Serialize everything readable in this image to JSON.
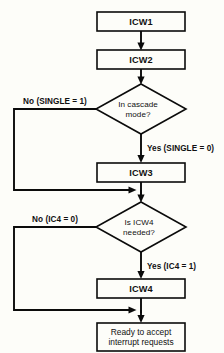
{
  "diagram": {
    "background_color": "#fdfdf9",
    "line_color": "#0b0b0b",
    "nodes": {
      "icw1": {
        "label": "ICW1",
        "type": "process"
      },
      "icw2": {
        "label": "ICW2",
        "type": "process"
      },
      "cascade_decision": {
        "type": "decision",
        "line1": "In cascade",
        "line2": "mode?"
      },
      "icw3": {
        "label": "ICW3",
        "type": "process"
      },
      "icw4_decision": {
        "type": "decision",
        "line1": "Is ICW4",
        "line2": "needed?"
      },
      "icw4": {
        "label": "ICW4",
        "type": "process"
      },
      "ready": {
        "type": "terminal",
        "line1": "Ready to accept",
        "line2": "interrupt requests"
      }
    },
    "edges": {
      "cascade_no": "No (SINGLE = 1)",
      "cascade_yes": "Yes (SINGLE = 0)",
      "icw4_no": "No (IC4 = 0)",
      "icw4_yes": "Yes (IC4 = 1)"
    }
  }
}
